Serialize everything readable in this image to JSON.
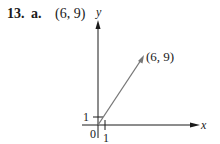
{
  "problem": {
    "number": "13.",
    "part": "a.",
    "answer": "(6, 9)"
  },
  "diagram": {
    "x_axis_label": "x",
    "y_axis_label": "y",
    "origin_label": "0",
    "x_tick_label": "1",
    "y_tick_label": "1",
    "vector_tip_label": "(6, 9)",
    "vector": {
      "from": [
        0,
        0
      ],
      "to": [
        6,
        9
      ]
    },
    "colors": {
      "axes": "#1a1a1a",
      "vector": "#777777"
    }
  }
}
